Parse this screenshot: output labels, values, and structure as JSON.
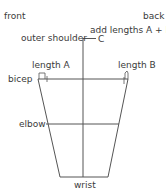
{
  "labels": {
    "front": "front",
    "back": "back",
    "add_lengths": "add lengths A + B",
    "outer_shoulder": "outer shoulder",
    "c": "C",
    "length_a": "length A",
    "length_b": "length B",
    "bicep": "bicep",
    "elbow": "elbow",
    "wrist": "wrist"
  },
  "colors": {
    "line": "#555555",
    "text": "#3a3a3a"
  }
}
